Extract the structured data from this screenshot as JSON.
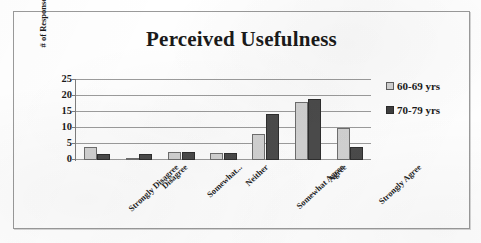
{
  "chart_data": {
    "type": "bar",
    "title": "Perceived Usefulness",
    "xlabel": "",
    "ylabel": "# of Responses",
    "ylim": [
      0,
      25
    ],
    "yticks": [
      0,
      5,
      10,
      15,
      20,
      25
    ],
    "grid": true,
    "legend_position": "right",
    "categories": [
      "Strongly Disagree",
      "Disagree",
      "Somewhat...",
      "Neither",
      "Somewhat Agree",
      "Agree",
      "Strongly Agree"
    ],
    "series": [
      {
        "name": "60-69 yrs",
        "color": "#d2d2d2",
        "values": [
          4,
          0.7,
          2.5,
          2.2,
          8,
          18,
          10
        ]
      },
      {
        "name": "70-79 yrs",
        "color": "#4b4b4b",
        "values": [
          2,
          2,
          2.5,
          2.3,
          14.5,
          19,
          4
        ]
      }
    ]
  },
  "legend": {
    "entries": [
      {
        "label": "60-69 yrs",
        "swatch": "legend-swatch-light"
      },
      {
        "label": "70-79 yrs",
        "swatch": "legend-swatch-dark"
      }
    ]
  },
  "colors": {
    "series_60_69": "#d2d2d2",
    "series_70_79": "#4b4b4b",
    "gridline": "#9c9c9c",
    "frame_border": "#9a9a9a",
    "text": "#1a1a1a"
  }
}
